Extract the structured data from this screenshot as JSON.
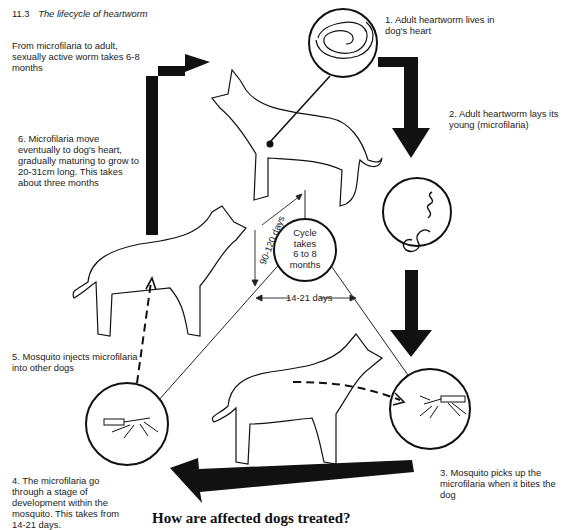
{
  "figure": {
    "number": "11.3",
    "caption": "The lifecycle of heartworm"
  },
  "notes": {
    "maturation_time": "From microfilaria to adult, sexually active worm takes 6-8 months"
  },
  "steps": [
    {
      "id": 1,
      "text": "1. Adult heartworm lives in dog's heart"
    },
    {
      "id": 2,
      "text": "2. Adult heartworm lays its young (microfilaria)"
    },
    {
      "id": 3,
      "text": "3. Mosquito picks up the microfilaria when it bites the dog"
    },
    {
      "id": 4,
      "text": "4. The microfilaria go through a stage of development within the mosquito. This takes from 14-21 days."
    },
    {
      "id": 5,
      "text": "5. Mosquito injects microfilaria into other dogs"
    },
    {
      "id": 6,
      "text": "6. Microfilaria move eventually to dog's heart, gradually maturing to grow to 20-31cm long. This takes about three months"
    }
  ],
  "center": {
    "line1": "Cycle",
    "line2": "takes",
    "line3": "6 to 8",
    "line4": "months"
  },
  "durations": {
    "left_edge": "90-120 days",
    "bottom_edge": "14-21 days"
  },
  "illustrations": {
    "circle_1": "adult-heartworm-coiled",
    "circle_2": "microfilaria-larvae",
    "circle_3": "mosquito-biting",
    "circle_4": "mosquito-carrying"
  },
  "colors": {
    "ink": "#111111",
    "background": "#ffffff"
  },
  "next_section": {
    "heading": "How are affected dogs treated?"
  }
}
